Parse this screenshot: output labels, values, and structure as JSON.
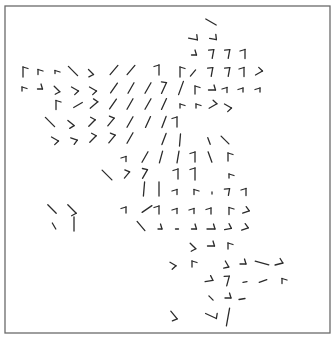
{
  "chart_data": {
    "type": "barb",
    "title": "",
    "xlabel": "",
    "ylabel": "",
    "grid": false,
    "legend": null,
    "frame": {
      "x": 5,
      "y": 6,
      "width": 325,
      "height": 327,
      "color": "#6a6a6a"
    },
    "barb_color": "#2b2b2b",
    "barbs": [
      {
        "x": 211,
        "y": 22,
        "dir": 120,
        "len": 12,
        "ticks": 0,
        "tside": 1
      },
      {
        "x": 193,
        "y": 39,
        "dir": 100,
        "len": 9,
        "ticks": 1,
        "tside": -1
      },
      {
        "x": 213,
        "y": 39,
        "dir": 100,
        "len": 7,
        "ticks": 1,
        "tside": -1
      },
      {
        "x": 194,
        "y": 55,
        "dir": 90,
        "len": 5,
        "ticks": 1,
        "tside": -1
      },
      {
        "x": 213,
        "y": 54,
        "dir": 10,
        "len": 9,
        "ticks": 1,
        "tside": -1
      },
      {
        "x": 229,
        "y": 54,
        "dir": 10,
        "len": 9,
        "ticks": 1,
        "tside": -1
      },
      {
        "x": 245,
        "y": 54,
        "dir": 0,
        "len": 9,
        "ticks": 1,
        "tside": -1
      },
      {
        "x": 23,
        "y": 72,
        "dir": 0,
        "len": 10,
        "ticks": 1,
        "tside": 1
      },
      {
        "x": 38,
        "y": 72,
        "dir": 0,
        "len": 5,
        "ticks": 1,
        "tside": 1
      },
      {
        "x": 55,
        "y": 72,
        "dir": 0,
        "len": 3,
        "ticks": 1,
        "tside": 1
      },
      {
        "x": 73,
        "y": 71,
        "dir": 135,
        "len": 13,
        "ticks": 0,
        "tside": 1
      },
      {
        "x": 91,
        "y": 72,
        "dir": 135,
        "len": 7,
        "ticks": 1,
        "tside": 1
      },
      {
        "x": 114,
        "y": 70,
        "dir": 40,
        "len": 12,
        "ticks": 0,
        "tside": 1
      },
      {
        "x": 131,
        "y": 70,
        "dir": 40,
        "len": 12,
        "ticks": 0,
        "tside": 1
      },
      {
        "x": 159,
        "y": 70,
        "dir": 0,
        "len": 10,
        "ticks": 1,
        "tside": -1
      },
      {
        "x": 180,
        "y": 72,
        "dir": 0,
        "len": 10,
        "ticks": 1,
        "tside": 1
      },
      {
        "x": 193,
        "y": 73,
        "dir": 40,
        "len": 8,
        "ticks": 0,
        "tside": 1
      },
      {
        "x": 212,
        "y": 72,
        "dir": 10,
        "len": 9,
        "ticks": 1,
        "tside": -1
      },
      {
        "x": 229,
        "y": 72,
        "dir": 10,
        "len": 9,
        "ticks": 1,
        "tside": -1
      },
      {
        "x": 244,
        "y": 72,
        "dir": 0,
        "len": 9,
        "ticks": 1,
        "tside": -1
      },
      {
        "x": 259,
        "y": 73,
        "dir": 60,
        "len": 8,
        "ticks": 1,
        "tside": -1
      },
      {
        "x": 22,
        "y": 89,
        "dir": 0,
        "len": 4,
        "ticks": 1,
        "tside": 1
      },
      {
        "x": 40,
        "y": 89,
        "dir": 90,
        "len": 5,
        "ticks": 1,
        "tside": -1
      },
      {
        "x": 57,
        "y": 89,
        "dir": 135,
        "len": 8,
        "ticks": 1,
        "tside": 1
      },
      {
        "x": 75,
        "y": 89,
        "dir": 120,
        "len": 8,
        "ticks": 1,
        "tside": 1
      },
      {
        "x": 93,
        "y": 89,
        "dir": 120,
        "len": 8,
        "ticks": 1,
        "tside": 1
      },
      {
        "x": 114,
        "y": 88,
        "dir": 35,
        "len": 12,
        "ticks": 0,
        "tside": 1
      },
      {
        "x": 131,
        "y": 88,
        "dir": 30,
        "len": 12,
        "ticks": 0,
        "tside": 1
      },
      {
        "x": 148,
        "y": 88,
        "dir": 30,
        "len": 12,
        "ticks": 0,
        "tside": 1
      },
      {
        "x": 164,
        "y": 88,
        "dir": 25,
        "len": 12,
        "ticks": 1,
        "tside": -1
      },
      {
        "x": 181,
        "y": 88,
        "dir": 20,
        "len": 14,
        "ticks": 0,
        "tside": 1
      },
      {
        "x": 195,
        "y": 90,
        "dir": 0,
        "len": 8,
        "ticks": 1,
        "tside": 1
      },
      {
        "x": 212,
        "y": 90,
        "dir": 90,
        "len": 7,
        "ticks": 1,
        "tside": -1
      },
      {
        "x": 227,
        "y": 90,
        "dir": 0,
        "len": 5,
        "ticks": 1,
        "tside": -1
      },
      {
        "x": 243,
        "y": 90,
        "dir": 0,
        "len": 4,
        "ticks": 1,
        "tside": -1
      },
      {
        "x": 260,
        "y": 90,
        "dir": 0,
        "len": 4,
        "ticks": 1,
        "tside": -1
      },
      {
        "x": 56,
        "y": 105,
        "dir": 0,
        "len": 9,
        "ticks": 1,
        "tside": 1
      },
      {
        "x": 78,
        "y": 105,
        "dir": 60,
        "len": 10,
        "ticks": 0,
        "tside": 1
      },
      {
        "x": 94,
        "y": 105,
        "dir": 50,
        "len": 10,
        "ticks": 1,
        "tside": -1
      },
      {
        "x": 113,
        "y": 104,
        "dir": 35,
        "len": 12,
        "ticks": 0,
        "tside": 1
      },
      {
        "x": 130,
        "y": 104,
        "dir": 30,
        "len": 12,
        "ticks": 0,
        "tside": 1
      },
      {
        "x": 148,
        "y": 104,
        "dir": 30,
        "len": 12,
        "ticks": 0,
        "tside": 1
      },
      {
        "x": 164,
        "y": 104,
        "dir": 25,
        "len": 12,
        "ticks": 0,
        "tside": 1
      },
      {
        "x": 180,
        "y": 106,
        "dir": 0,
        "len": 4,
        "ticks": 1,
        "tside": 1
      },
      {
        "x": 196,
        "y": 106,
        "dir": 0,
        "len": 4,
        "ticks": 1,
        "tside": 1
      },
      {
        "x": 213,
        "y": 106,
        "dir": 60,
        "len": 9,
        "ticks": 1,
        "tside": -1
      },
      {
        "x": 228,
        "y": 106,
        "dir": 120,
        "len": 8,
        "ticks": 1,
        "tside": 1
      },
      {
        "x": 50,
        "y": 122,
        "dir": 135,
        "len": 13,
        "ticks": 0,
        "tside": 1
      },
      {
        "x": 71,
        "y": 123,
        "dir": 130,
        "len": 8,
        "ticks": 1,
        "tside": 1
      },
      {
        "x": 92,
        "y": 123,
        "dir": 45,
        "len": 9,
        "ticks": 1,
        "tside": -1
      },
      {
        "x": 111,
        "y": 122,
        "dir": 40,
        "len": 10,
        "ticks": 1,
        "tside": -1
      },
      {
        "x": 130,
        "y": 122,
        "dir": 30,
        "len": 12,
        "ticks": 0,
        "tside": 1
      },
      {
        "x": 148,
        "y": 122,
        "dir": 25,
        "len": 12,
        "ticks": 0,
        "tside": 1
      },
      {
        "x": 164,
        "y": 122,
        "dir": 20,
        "len": 12,
        "ticks": 0,
        "tside": 1
      },
      {
        "x": 177,
        "y": 122,
        "dir": 0,
        "len": 10,
        "ticks": 1,
        "tside": -1
      },
      {
        "x": 55,
        "y": 139,
        "dir": 120,
        "len": 8,
        "ticks": 1,
        "tside": 1
      },
      {
        "x": 74,
        "y": 139,
        "dir": 110,
        "len": 7,
        "ticks": 1,
        "tside": 1
      },
      {
        "x": 93,
        "y": 139,
        "dir": 45,
        "len": 9,
        "ticks": 1,
        "tside": -1
      },
      {
        "x": 112,
        "y": 139,
        "dir": 40,
        "len": 10,
        "ticks": 1,
        "tside": -1
      },
      {
        "x": 130,
        "y": 138,
        "dir": 30,
        "len": 12,
        "ticks": 0,
        "tside": 1
      },
      {
        "x": 164,
        "y": 139,
        "dir": 20,
        "len": 12,
        "ticks": 0,
        "tside": 1
      },
      {
        "x": 180,
        "y": 140,
        "dir": 5,
        "len": 12,
        "ticks": 0,
        "tside": 1
      },
      {
        "x": 209,
        "y": 141,
        "dir": 160,
        "len": 7,
        "ticks": 0,
        "tside": 1
      },
      {
        "x": 225,
        "y": 140,
        "dir": 135,
        "len": 11,
        "ticks": 0,
        "tside": 1
      },
      {
        "x": 126,
        "y": 159,
        "dir": 0,
        "len": 5,
        "ticks": 1,
        "tside": -1
      },
      {
        "x": 145,
        "y": 157,
        "dir": 30,
        "len": 12,
        "ticks": 0,
        "tside": 1
      },
      {
        "x": 161,
        "y": 157,
        "dir": 15,
        "len": 12,
        "ticks": 0,
        "tside": 1
      },
      {
        "x": 178,
        "y": 157,
        "dir": 10,
        "len": 12,
        "ticks": 0,
        "tside": 1
      },
      {
        "x": 195,
        "y": 157,
        "dir": 0,
        "len": 10,
        "ticks": 1,
        "tside": -1
      },
      {
        "x": 210,
        "y": 157,
        "dir": 160,
        "len": 11,
        "ticks": 0,
        "tside": 1
      },
      {
        "x": 228,
        "y": 157,
        "dir": 0,
        "len": 8,
        "ticks": 1,
        "tside": 1
      },
      {
        "x": 107,
        "y": 175,
        "dir": 135,
        "len": 14,
        "ticks": 0,
        "tside": 1
      },
      {
        "x": 127,
        "y": 175,
        "dir": 40,
        "len": 8,
        "ticks": 1,
        "tside": -1
      },
      {
        "x": 145,
        "y": 174,
        "dir": 30,
        "len": 10,
        "ticks": 1,
        "tside": -1
      },
      {
        "x": 178,
        "y": 174,
        "dir": 0,
        "len": 10,
        "ticks": 1,
        "tside": -1
      },
      {
        "x": 195,
        "y": 174,
        "dir": 0,
        "len": 12,
        "ticks": 1,
        "tside": -1
      },
      {
        "x": 229,
        "y": 176,
        "dir": 0,
        "len": 4,
        "ticks": 1,
        "tside": 1
      },
      {
        "x": 144,
        "y": 189,
        "dir": 5,
        "len": 14,
        "ticks": 0,
        "tside": 1
      },
      {
        "x": 159,
        "y": 189,
        "dir": 0,
        "len": 14,
        "ticks": 0,
        "tside": 1
      },
      {
        "x": 177,
        "y": 192,
        "dir": 0,
        "len": 5,
        "ticks": 1,
        "tside": -1
      },
      {
        "x": 194,
        "y": 192,
        "dir": 0,
        "len": 5,
        "ticks": 1,
        "tside": 1
      },
      {
        "x": 212,
        "y": 193,
        "dir": 0,
        "len": 2,
        "ticks": 0,
        "tside": 1
      },
      {
        "x": 229,
        "y": 192,
        "dir": 10,
        "len": 7,
        "ticks": 1,
        "tside": -1
      },
      {
        "x": 246,
        "y": 192,
        "dir": 0,
        "len": 7,
        "ticks": 1,
        "tside": -1
      },
      {
        "x": 52,
        "y": 209,
        "dir": 135,
        "len": 12,
        "ticks": 0,
        "tside": 1
      },
      {
        "x": 72,
        "y": 209,
        "dir": 135,
        "len": 12,
        "ticks": 1,
        "tside": 1
      },
      {
        "x": 126,
        "y": 210,
        "dir": 0,
        "len": 6,
        "ticks": 1,
        "tside": -1
      },
      {
        "x": 147,
        "y": 209,
        "dir": 55,
        "len": 12,
        "ticks": 0,
        "tside": 1
      },
      {
        "x": 159,
        "y": 210,
        "dir": 0,
        "len": 8,
        "ticks": 1,
        "tside": -1
      },
      {
        "x": 177,
        "y": 211,
        "dir": 0,
        "len": 5,
        "ticks": 1,
        "tside": -1
      },
      {
        "x": 194,
        "y": 211,
        "dir": 0,
        "len": 5,
        "ticks": 1,
        "tside": -1
      },
      {
        "x": 211,
        "y": 211,
        "dir": 0,
        "len": 6,
        "ticks": 1,
        "tside": -1
      },
      {
        "x": 229,
        "y": 211,
        "dir": 0,
        "len": 7,
        "ticks": 1,
        "tside": 1
      },
      {
        "x": 246,
        "y": 212,
        "dir": 70,
        "len": 7,
        "ticks": 1,
        "tside": -1
      },
      {
        "x": 54,
        "y": 226,
        "dir": 150,
        "len": 7,
        "ticks": 0,
        "tside": 1
      },
      {
        "x": 74,
        "y": 224,
        "dir": 0,
        "len": 14,
        "ticks": 0,
        "tside": 1
      },
      {
        "x": 141,
        "y": 226,
        "dir": 140,
        "len": 12,
        "ticks": 0,
        "tside": 1
      },
      {
        "x": 160,
        "y": 229,
        "dir": 90,
        "len": 4,
        "ticks": 1,
        "tside": -1
      },
      {
        "x": 177,
        "y": 229,
        "dir": 90,
        "len": 3,
        "ticks": 0,
        "tside": 1
      },
      {
        "x": 194,
        "y": 229,
        "dir": 90,
        "len": 5,
        "ticks": 1,
        "tside": -1
      },
      {
        "x": 211,
        "y": 229,
        "dir": 90,
        "len": 8,
        "ticks": 1,
        "tside": -1
      },
      {
        "x": 228,
        "y": 229,
        "dir": 80,
        "len": 7,
        "ticks": 1,
        "tside": -1
      },
      {
        "x": 245,
        "y": 229,
        "dir": 70,
        "len": 7,
        "ticks": 1,
        "tside": -1
      },
      {
        "x": 193,
        "y": 246,
        "dir": 135,
        "len": 8,
        "ticks": 1,
        "tside": 1
      },
      {
        "x": 211,
        "y": 246,
        "dir": 90,
        "len": 7,
        "ticks": 1,
        "tside": -1
      },
      {
        "x": 228,
        "y": 246,
        "dir": 0,
        "len": 6,
        "ticks": 1,
        "tside": 1
      },
      {
        "x": 173,
        "y": 264,
        "dir": 120,
        "len": 7,
        "ticks": 1,
        "tside": 1
      },
      {
        "x": 192,
        "y": 264,
        "dir": 0,
        "len": 6,
        "ticks": 1,
        "tside": 1
      },
      {
        "x": 227,
        "y": 264,
        "dir": 150,
        "len": 7,
        "ticks": 1,
        "tside": 1
      },
      {
        "x": 243,
        "y": 264,
        "dir": 90,
        "len": 6,
        "ticks": 1,
        "tside": -1
      },
      {
        "x": 262,
        "y": 263,
        "dir": 105,
        "len": 14,
        "ticks": 0,
        "tside": 1
      },
      {
        "x": 279,
        "y": 264,
        "dir": 75,
        "len": 8,
        "ticks": 1,
        "tside": -1
      },
      {
        "x": 209,
        "y": 281,
        "dir": 80,
        "len": 8,
        "ticks": 1,
        "tside": -1
      },
      {
        "x": 228,
        "y": 281,
        "dir": 15,
        "len": 10,
        "ticks": 1,
        "tside": -1
      },
      {
        "x": 245,
        "y": 282,
        "dir": 80,
        "len": 4,
        "ticks": 0,
        "tside": 1
      },
      {
        "x": 263,
        "y": 281,
        "dir": 70,
        "len": 8,
        "ticks": 0,
        "tside": 1
      },
      {
        "x": 282,
        "y": 281,
        "dir": 0,
        "len": 5,
        "ticks": 1,
        "tside": 1
      },
      {
        "x": 211,
        "y": 298,
        "dir": 135,
        "len": 6,
        "ticks": 0,
        "tside": 1
      },
      {
        "x": 228,
        "y": 298,
        "dir": 90,
        "len": 6,
        "ticks": 1,
        "tside": -1
      },
      {
        "x": 242,
        "y": 299,
        "dir": 80,
        "len": 6,
        "ticks": 0,
        "tside": 1
      },
      {
        "x": 174,
        "y": 315,
        "dir": 140,
        "len": 10,
        "ticks": 1,
        "tside": 1
      },
      {
        "x": 211,
        "y": 316,
        "dir": 115,
        "len": 12,
        "ticks": 1,
        "tside": -1
      },
      {
        "x": 228,
        "y": 317,
        "dir": 10,
        "len": 18,
        "ticks": 0,
        "tside": 1
      }
    ]
  }
}
